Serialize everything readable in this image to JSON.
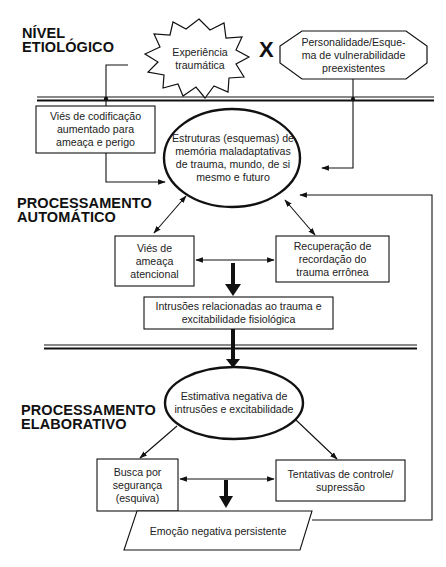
{
  "diagram": {
    "levels": {
      "etiological": "NÍVEL\nETIOLÓGICO",
      "automatic": "PROCESSAMENTO\nAUTOMÁTICO",
      "elaborative": "PROCESSAMENTO\nELABORATIVO"
    },
    "operator": "X",
    "nodes": {
      "traumatic_experience": "Experiência\ntraumática",
      "vulnerability_schema": "Personalidade/Esque-\nma de vulnerabilidade\npreexistentes",
      "encoding_bias": "Viés de codificação\naumentado para\nameaça e perigo",
      "memory_structures": "Estruturas (esquemas) de\nmemória maladaptativas\nde trauma, mundo, de si\nmesmo e futuro",
      "attentional_bias": "Viés de\nameaça\natencional",
      "memory_retrieval": "Recuperação de\nrecordação do\ntrauma errônea",
      "intrusions": "Intrusões relacionadas ao trauma e\nexcitabilidade fisiológica",
      "negative_appraisal": "Estimativa negativa de\nintrusões e excitabilidade",
      "safety_seeking": "Busca por\nsegurança\n(esquiva)",
      "control_attempts": "Tentativas de controle/\nsupressão",
      "persistent_emotion": "Emoção negativa persistente"
    },
    "edges": [
      {
        "from": "traumatic_experience",
        "to": "encoding_bias"
      },
      {
        "from": "encoding_bias",
        "to": "memory_structures"
      },
      {
        "from": "vulnerability_schema",
        "to": "memory_structures"
      },
      {
        "from": "memory_structures",
        "to": "attentional_bias",
        "bidirectional": true
      },
      {
        "from": "memory_structures",
        "to": "memory_retrieval",
        "bidirectional": true
      },
      {
        "from": "attentional_bias",
        "to": "memory_retrieval",
        "bidirectional": true
      },
      {
        "from": "attentional_bias+memory_retrieval",
        "to": "intrusions",
        "style": "bold"
      },
      {
        "from": "intrusions",
        "to": "negative_appraisal",
        "style": "bold"
      },
      {
        "from": "negative_appraisal",
        "to": "safety_seeking"
      },
      {
        "from": "negative_appraisal",
        "to": "control_attempts"
      },
      {
        "from": "safety_seeking",
        "to": "control_attempts",
        "bidirectional": true
      },
      {
        "from": "safety_seeking+control_attempts",
        "to": "persistent_emotion",
        "style": "bold"
      },
      {
        "from": "persistent_emotion",
        "to": "memory_structures",
        "style": "feedback"
      }
    ],
    "colors": {
      "line": "#111111",
      "text": "#222222",
      "background": "#ffffff"
    }
  }
}
